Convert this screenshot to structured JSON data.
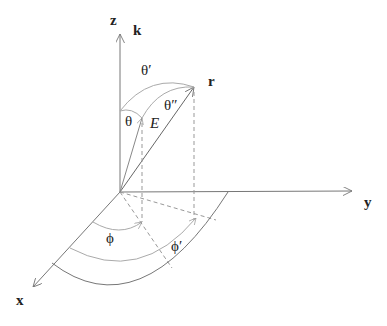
{
  "diagram": {
    "type": "3d-coordinate-system",
    "axes": {
      "z": "z",
      "k": "k",
      "y": "y",
      "x": "x"
    },
    "vectors": {
      "r": "r",
      "E": "E"
    },
    "angles": {
      "theta": "θ",
      "theta_prime": "θ′",
      "theta_double_prime": "θ″",
      "phi": "ϕ",
      "phi_prime": "ϕ′"
    },
    "colors": {
      "axis": "#777777",
      "arc": "#aaaaaa",
      "text": "#222222"
    }
  }
}
